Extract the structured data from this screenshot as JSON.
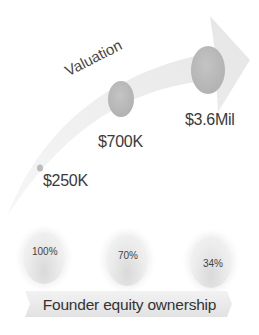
{
  "valuation": {
    "title": "Valuation",
    "points": [
      {
        "label": "$250K",
        "value": 250000
      },
      {
        "label": "$700K",
        "value": 700000
      },
      {
        "label": "$3.6Mil",
        "value": 3600000
      }
    ]
  },
  "equity": {
    "title": "Founder equity ownership",
    "points": [
      {
        "label": "100%",
        "value": 100
      },
      {
        "label": "70%",
        "value": 70
      },
      {
        "label": "34%",
        "value": 34
      }
    ]
  },
  "colors": {
    "arrow": "#ececec",
    "valuation_dot": "#bdbdbd",
    "text": "#3a3a3a",
    "banner": "#e9e9e9"
  }
}
